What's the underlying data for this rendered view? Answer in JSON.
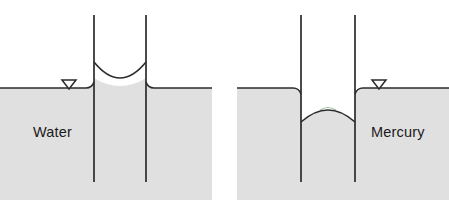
{
  "figure": {
    "width": 449,
    "height": 212,
    "background_color": "#ffffff",
    "liquid_fill_color": "#e0e0e0",
    "outline_color": "#2b2b2b"
  },
  "panels": [
    {
      "id": "water",
      "label": "Water",
      "label_position": {
        "x": 33,
        "y": 137
      },
      "meniscus_type": "concave",
      "effect": "capillary rise",
      "reservoir": {
        "left": 0,
        "right": 212,
        "surface_y": 88,
        "bottom_y": 200
      },
      "tube": {
        "left_wall_x": 94,
        "right_wall_x": 146,
        "top_y": 15,
        "bottom_y": 182
      },
      "meniscus": {
        "edge_y": 62,
        "center_y": 78
      },
      "level_marker": {
        "name": "water-level-triangle",
        "center_x": 69,
        "top_y": 80,
        "half_width": 7,
        "height": 9
      }
    },
    {
      "id": "mercury",
      "label": "Mercury",
      "label_position": {
        "x": 371,
        "y": 137
      },
      "meniscus_type": "convex",
      "effect": "capillary depression",
      "reservoir": {
        "left": 237,
        "right": 449,
        "surface_y": 88,
        "bottom_y": 200
      },
      "tube": {
        "left_wall_x": 301,
        "right_wall_x": 355,
        "top_y": 15,
        "bottom_y": 182
      },
      "meniscus": {
        "edge_y": 122,
        "center_y": 110
      },
      "level_marker": {
        "name": "mercury-level-triangle",
        "center_x": 379,
        "top_y": 80,
        "half_width": 7,
        "height": 9
      }
    }
  ]
}
